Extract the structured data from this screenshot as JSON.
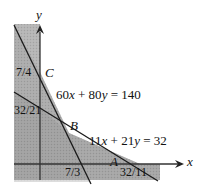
{
  "figure": {
    "axes": {
      "x_label": "x",
      "y_label": "y"
    },
    "lines": [
      {
        "id": "line1",
        "equation": "60x + 80y = 140"
      },
      {
        "id": "line2",
        "equation": "11x + 21y = 32"
      }
    ],
    "points": {
      "A": "A",
      "B": "B",
      "C": "C"
    },
    "tick_labels": {
      "y_upper": "7/4",
      "y_lower": "32/21",
      "x_left": "7/3",
      "x_right": "32/11"
    },
    "colors": {
      "shade_light": "#b9b9b9",
      "shade_dark": "#8f8f8f",
      "line": "#1a1a1a",
      "background": "#ffffff"
    }
  },
  "chart_data": {
    "type": "diagram",
    "title": "",
    "constraints": [
      {
        "equation": "60x + 80y = 140",
        "x_intercept": "7/3",
        "y_intercept": "7/4"
      },
      {
        "equation": "11x + 21y = 32",
        "x_intercept": "32/11",
        "y_intercept": "32/21"
      }
    ],
    "vertices": [
      {
        "label": "C",
        "x": 0,
        "y": 1.75
      },
      {
        "label": "B",
        "x": 1,
        "y": 1
      },
      {
        "label": "A",
        "x": 2.909,
        "y": 0
      }
    ],
    "xlabel": "x",
    "ylabel": "y"
  }
}
